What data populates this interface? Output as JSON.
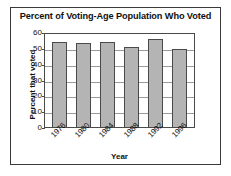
{
  "chart_data": {
    "type": "bar",
    "title": "Percent of Voting-Age Population Who Voted",
    "xlabel": "Year",
    "ylabel": "Percent that voted",
    "categories": [
      "1976",
      "1980",
      "1984",
      "1988",
      "1992",
      "1996"
    ],
    "values": [
      54,
      53,
      53.5,
      50.5,
      55.5,
      49
    ],
    "yticks": [
      "0",
      "10",
      "20",
      "30",
      "40",
      "50",
      "60"
    ],
    "ytick_values": [
      0,
      10,
      20,
      30,
      40,
      50,
      60
    ],
    "ylim": [
      0,
      60
    ],
    "grid": true,
    "legend": "none",
    "bar_color": "#b4b4b4",
    "bar_edge_color": "#4a4a4a",
    "axis_color": "#4a4a4a",
    "grid_color": "#9a9a9a",
    "text_color": "#111111",
    "background": "#ffffff"
  }
}
